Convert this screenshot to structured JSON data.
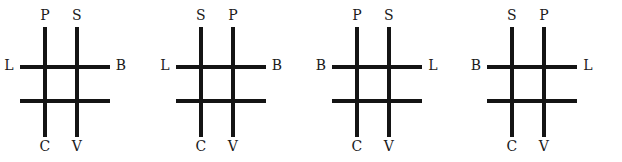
{
  "figure": {
    "type": "grid-diagram-set",
    "panel_count": 4,
    "grid": {
      "rows": 2,
      "columns": 2,
      "line_color": "#141414",
      "background_color": "#ffffff"
    },
    "panels": [
      {
        "index": 1,
        "labels": {
          "top_left": "P",
          "top_right": "S",
          "left": "L",
          "right": "B",
          "bottom_left": "C",
          "bottom_right": "V"
        }
      },
      {
        "index": 2,
        "labels": {
          "top_left": "S",
          "top_right": "P",
          "left": "L",
          "right": "B",
          "bottom_left": "C",
          "bottom_right": "V"
        }
      },
      {
        "index": 3,
        "labels": {
          "top_left": "P",
          "top_right": "S",
          "left": "B",
          "right": "L",
          "bottom_left": "C",
          "bottom_right": "V"
        }
      },
      {
        "index": 4,
        "labels": {
          "top_left": "S",
          "top_right": "P",
          "left": "B",
          "right": "L",
          "bottom_left": "C",
          "bottom_right": "V"
        }
      }
    ]
  }
}
